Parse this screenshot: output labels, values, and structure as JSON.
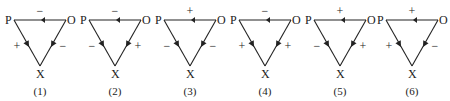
{
  "figure": {
    "vertex_labels": {
      "p": "P",
      "o": "O",
      "x": "X"
    },
    "panels": [
      {
        "caption": "(1)",
        "po": "−",
        "px": "+",
        "ox": "−"
      },
      {
        "caption": "(2)",
        "po": "−",
        "px": "−",
        "ox": "+"
      },
      {
        "caption": "(3)",
        "po": "+",
        "px": "−",
        "ox": "−"
      },
      {
        "caption": "(4)",
        "po": "−",
        "px": "+",
        "ox": "+"
      },
      {
        "caption": "(5)",
        "po": "+",
        "px": "−",
        "ox": "+"
      },
      {
        "caption": "(6)",
        "po": "+",
        "px": "+",
        "ox": "−"
      }
    ]
  },
  "colors": {
    "line": "#222222",
    "background": "#ffffff"
  }
}
